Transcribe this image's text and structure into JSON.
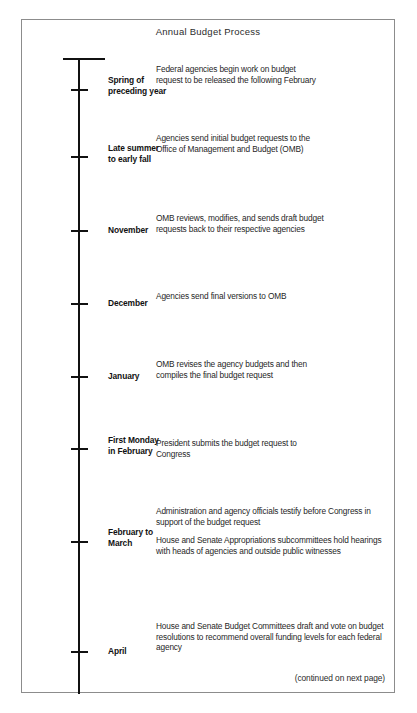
{
  "figure": {
    "title": "Annual Budget Process",
    "footer_note": "(continued on next page)"
  },
  "timeline": {
    "events": [
      {
        "period": "Spring of\npreceding year",
        "period_line1": "Spring of",
        "period_line2": "preceding year",
        "paragraphs": [
          "Federal agencies begin work on budget request to be released the following February"
        ]
      },
      {
        "period": "Late summer\nto early fall",
        "period_line1": "Late summer",
        "period_line2": "to early fall",
        "paragraphs": [
          "Agencies send initial budget requests to the Office of Management and Budget (OMB)"
        ]
      },
      {
        "period": "November",
        "period_line1": "November",
        "period_line2": "",
        "paragraphs": [
          "OMB reviews, modifies, and sends draft budget requests back to their respective agencies"
        ]
      },
      {
        "period": "December",
        "period_line1": "December",
        "period_line2": "",
        "paragraphs": [
          "Agencies send final versions to OMB"
        ]
      },
      {
        "period": "January",
        "period_line1": "January",
        "period_line2": "",
        "paragraphs": [
          "OMB revises the agency budgets and then compiles the final budget request"
        ]
      },
      {
        "period": "First Monday\nin February",
        "period_line1": "First Monday",
        "period_line2": "in February",
        "paragraphs": [
          "President submits the budget request to Congress"
        ]
      },
      {
        "period": "February to\nMarch",
        "period_line1": "February to",
        "period_line2": "March",
        "paragraphs": [
          "Administration and agency officials testify before Congress in support of the budget request",
          "House and Senate Appropriations subcommittees hold hearings with heads of agencies and outside public witnesses"
        ]
      },
      {
        "period": "April",
        "period_line1": "April",
        "period_line2": "",
        "paragraphs": [
          "House and Senate Budget Committees draft and vote on budget resolutions to recommend overall funding levels for each federal agency"
        ]
      }
    ]
  },
  "layout": {
    "tick_y": [
      88,
      155,
      229,
      302,
      375,
      447,
      540,
      650
    ],
    "period_y": [
      74,
      142,
      224,
      297,
      370,
      434,
      526,
      645
    ],
    "body_y": [
      63,
      132,
      212,
      290,
      358,
      437,
      505,
      620
    ],
    "body_width": [
      168,
      168,
      178,
      168,
      178,
      168,
      228,
      228
    ]
  },
  "colors": {
    "axis": "#111111",
    "frame": "#8c8c8c",
    "text": "#1f1f1f",
    "background": "#ffffff"
  }
}
